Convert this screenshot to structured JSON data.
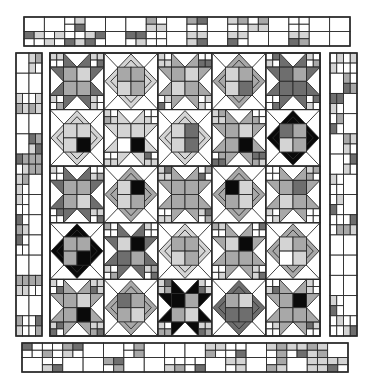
{
  "diagram": {
    "colors": {
      "white": "#ffffff",
      "light": "#d4d4d4",
      "medium": "#a8a8a8",
      "dark": "#6e6e6e",
      "black": "#0a0a0a",
      "line": "#2a2a2a"
    },
    "center": {
      "x": 50,
      "y": 53,
      "width": 270,
      "height": 283,
      "rows": 5,
      "cols": 5,
      "blocks": [
        [
          {
            "type": "star",
            "tone": "dark",
            "center": [
              "medium",
              "light",
              "medium",
              "medium"
            ]
          },
          {
            "type": "diamond",
            "tone": "light",
            "center": [
              "medium",
              "medium",
              "light",
              "medium"
            ]
          },
          {
            "type": "star",
            "tone": "medium",
            "center": [
              "medium",
              "light",
              "light",
              "medium"
            ]
          },
          {
            "type": "diamond",
            "tone": "medium",
            "center": [
              "light",
              "medium",
              "light",
              "dark"
            ]
          },
          {
            "type": "star",
            "tone": "dark",
            "center": [
              "dark",
              "medium",
              "dark",
              "dark"
            ]
          }
        ],
        [
          {
            "type": "diamond",
            "tone": "light",
            "center": [
              "light",
              "light",
              "light",
              "black"
            ]
          },
          {
            "type": "star",
            "tone": "light",
            "center": [
              "light",
              "light",
              "white",
              "black"
            ]
          },
          {
            "type": "diamond",
            "tone": "light",
            "center": [
              "light",
              "dark",
              "light",
              "dark"
            ]
          },
          {
            "type": "star",
            "tone": "medium",
            "center": [
              "medium",
              "light",
              "medium",
              "black"
            ]
          },
          {
            "type": "diamond",
            "tone": "black",
            "center": [
              "dark",
              "medium",
              "light",
              "medium"
            ]
          }
        ],
        [
          {
            "type": "star",
            "tone": "dark",
            "center": [
              "medium",
              "medium",
              "medium",
              "light"
            ]
          },
          {
            "type": "diamond",
            "tone": "medium",
            "center": [
              "light",
              "black",
              "light",
              "medium"
            ]
          },
          {
            "type": "star",
            "tone": "medium",
            "center": [
              "medium",
              "medium",
              "medium",
              "medium"
            ]
          },
          {
            "type": "diamond",
            "tone": "medium",
            "center": [
              "black",
              "light",
              "medium",
              "light"
            ]
          },
          {
            "type": "star",
            "tone": "medium",
            "center": [
              "medium",
              "dark",
              "light",
              "medium"
            ]
          }
        ],
        [
          {
            "type": "diamond",
            "tone": "black",
            "center": [
              "medium",
              "medium",
              "medium",
              "black"
            ]
          },
          {
            "type": "star",
            "tone": "dark",
            "center": [
              "light",
              "black",
              "dark",
              "medium"
            ]
          },
          {
            "type": "diamond",
            "tone": "light",
            "center": [
              "medium",
              "medium",
              "light",
              "medium"
            ]
          },
          {
            "type": "star",
            "tone": "medium",
            "center": [
              "light",
              "black",
              "medium",
              "medium"
            ]
          },
          {
            "type": "diamond",
            "tone": "medium",
            "center": [
              "light",
              "medium",
              "white",
              "light"
            ]
          }
        ],
        [
          {
            "type": "star",
            "tone": "medium",
            "center": [
              "medium",
              "light",
              "medium",
              "black"
            ]
          },
          {
            "type": "diamond",
            "tone": "medium",
            "center": [
              "dark",
              "medium",
              "medium",
              "light"
            ]
          },
          {
            "type": "star",
            "tone": "black",
            "center": [
              "black",
              "medium",
              "medium",
              "light"
            ]
          },
          {
            "type": "diamond",
            "tone": "dark",
            "center": [
              "medium",
              "light",
              "dark",
              "dark"
            ]
          },
          {
            "type": "star",
            "tone": "medium",
            "center": [
              "medium",
              "black",
              "medium",
              "medium"
            ]
          }
        ]
      ]
    },
    "borders": {
      "top": {
        "x": 24,
        "y": 17,
        "width": 326,
        "height": 29,
        "cols": 16,
        "rows": 2,
        "seed": 3
      },
      "bottom": {
        "x": 22,
        "y": 343,
        "width": 326,
        "height": 29,
        "cols": 16,
        "rows": 2,
        "seed": 11
      },
      "left": {
        "x": 16,
        "y": 53,
        "width": 26,
        "height": 283,
        "cols": 2,
        "rows": 14,
        "seed": 5
      },
      "right": {
        "x": 330,
        "y": 53,
        "width": 27,
        "height": 283,
        "cols": 2,
        "rows": 14,
        "seed": 9
      }
    }
  }
}
